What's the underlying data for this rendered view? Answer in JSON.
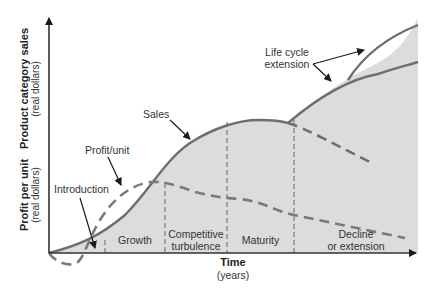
{
  "diagram": {
    "y_axis": {
      "upper_label": "Product category sales",
      "upper_sublabel": "(real dollars)",
      "lower_label": "Profit per unit",
      "lower_sublabel": "(real dollars)"
    },
    "x_axis": {
      "label": "Time",
      "sublabel": "(years)"
    },
    "stages": [
      {
        "label": "Introduction"
      },
      {
        "label": "Growth"
      },
      {
        "label_line1": "Competitive",
        "label_line2": "turbulence"
      },
      {
        "label": "Maturity"
      },
      {
        "label_line1": "Decline",
        "label_line2": "or extension"
      }
    ],
    "callouts": {
      "sales": "Sales",
      "profit": "Profit/unit",
      "introduction": "Introduction",
      "extension_line1": "Life cycle",
      "extension_line2": "extension"
    },
    "colors": {
      "fill": "#dcdcdc",
      "curve": "#6e6e6e",
      "axis": "#333333",
      "arrow": "#1a1a1a"
    }
  }
}
